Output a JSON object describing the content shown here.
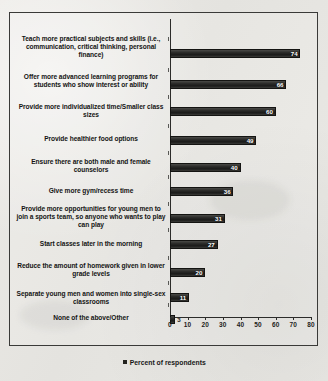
{
  "chart_data": {
    "type": "bar",
    "orientation": "horizontal",
    "title": "",
    "xlabel": "",
    "ylabel": "",
    "xlim": [
      0,
      80
    ],
    "xticks": [
      0,
      10,
      20,
      30,
      40,
      50,
      60,
      70,
      80
    ],
    "grid": false,
    "legend": {
      "position": "bottom",
      "entries": [
        "Percent of respondents"
      ]
    },
    "categories": [
      "Teach more practical subjects and skills (i.e., communication, critical thinking, personal finance)",
      "Offer more advanced learning programs for students who show interest or ability",
      "Provide more individualized time/Smaller class sizes",
      "Provide healthier food options",
      "Ensure there are both male and female counselors",
      "Give more gym/recess time",
      "Provide more opportunities for young men to join a sports team, so anyone who wants to play can play",
      "Start classes later in the morning",
      "Reduce the amount of homework given in lower grade levels",
      "Separate young men and women into single-sex classrooms",
      "None of the above/Other"
    ],
    "values": [
      74,
      66,
      60,
      49,
      40,
      36,
      31,
      27,
      20,
      11,
      3
    ],
    "series": [
      {
        "name": "Percent of respondents",
        "values": [
          74,
          66,
          60,
          49,
          40,
          36,
          31,
          27,
          20,
          11,
          3
        ]
      }
    ],
    "bar_color": "#23231f"
  },
  "legend_label": "Percent of respondents",
  "axis": {
    "tick_labels": [
      "0",
      "10",
      "20",
      "30",
      "40",
      "50",
      "60",
      "70",
      "80"
    ]
  },
  "bar_labels": [
    "74",
    "66",
    "60",
    "49",
    "40",
    "36",
    "31",
    "27",
    "20",
    "11",
    "3"
  ],
  "categories": [
    "Teach more practical subjects and skills (i.e., communication, critical thinking, personal finance)",
    "Offer more advanced learning programs for students who show interest or ability",
    "Provide more individualized time/Smaller class sizes",
    "Provide healthier food options",
    "Ensure there are both male and female counselors",
    "Give more gym/recess time",
    "Provide more opportunities for young men to join a sports team, so anyone who wants to play can play",
    "Start classes later in the morning",
    "Reduce the amount of homework given in lower grade levels",
    "Separate young men and women into single-sex classrooms",
    "None of the above/Other"
  ]
}
